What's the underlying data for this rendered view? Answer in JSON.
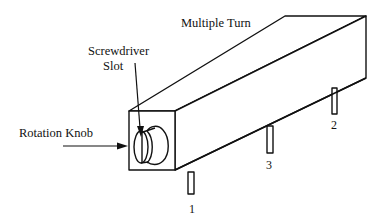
{
  "diagram": {
    "title": "Multiple Turn",
    "labels": {
      "screwdriver_line1": "Screwdriver",
      "screwdriver_line2": "Slot",
      "rotation_knob": "Rotation Knob"
    },
    "pins": [
      {
        "id": "pin-1",
        "label": "1"
      },
      {
        "id": "pin-3",
        "label": "3"
      },
      {
        "id": "pin-2",
        "label": "2"
      }
    ],
    "colors": {
      "stroke": "#111111",
      "background": "#ffffff"
    }
  }
}
